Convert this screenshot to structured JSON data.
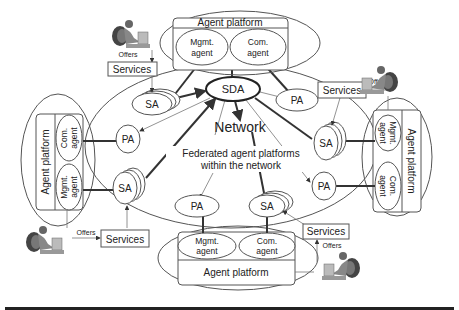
{
  "diagram": {
    "center": {
      "network_label": "Network",
      "federated_line1": "Federated agent platforms",
      "federated_line2": "within the network",
      "sda_label": "SDA"
    },
    "platforms": {
      "top": {
        "title": "Agent platform",
        "mgmt_line1": "Mgmt.",
        "mgmt_line2": "agent",
        "com_line1": "Com.",
        "com_line2": "agent"
      },
      "left": {
        "title": "Agent platform",
        "mgmt_line1": "Mgmt.",
        "mgmt_line2": "agent",
        "com_line1": "Com.",
        "com_line2": "agent"
      },
      "right": {
        "title": "Agent platform",
        "mgmt_line1": "Mgmt.",
        "mgmt_line2": "agent",
        "com_line1": "Com.",
        "com_line2": "agent"
      },
      "bottom": {
        "title": "Agent platform",
        "mgmt_line1": "Mgmt.",
        "mgmt_line2": "agent",
        "com_line1": "Com.",
        "com_line2": "agent"
      }
    },
    "nodes": {
      "sa_top_left": "SA",
      "pa_top_right": "PA",
      "pa_left": "PA",
      "sa_left": "SA",
      "sa_right": "SA",
      "pa_right": "PA",
      "pa_bottom": "PA",
      "sa_bottom": "SA"
    },
    "services": {
      "top_left": {
        "label": "Services",
        "offers": "Offers"
      },
      "right": {
        "label": "Services",
        "offers": "Offers"
      },
      "bottom_left": {
        "label": "Services",
        "offers": "Offers"
      },
      "bottom_right": {
        "label": "Services",
        "offers": "Offers"
      }
    },
    "icons": [
      "person-at-computer-icon"
    ]
  }
}
